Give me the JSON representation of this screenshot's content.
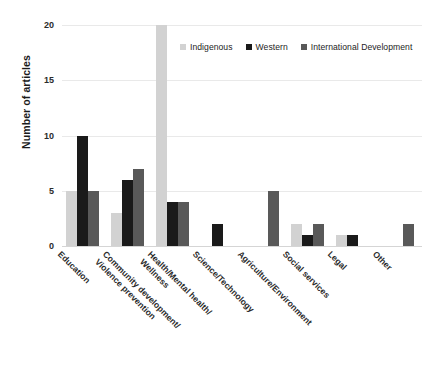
{
  "chart_data": {
    "type": "bar",
    "title": "",
    "subtitle": "",
    "xlabel": "",
    "ylabel": "Number of articles",
    "ylim": [
      0,
      20
    ],
    "yticks": [
      0,
      5,
      10,
      15,
      20
    ],
    "ytick_labels": [
      "0",
      "5",
      "10",
      "15",
      "20"
    ],
    "grid": true,
    "legend_position": "top-right",
    "categories": [
      "Education",
      "Community development/\nViolence prevention",
      "Health/Mental health/\nWellness",
      "Science/Technology",
      "Agriculture/Environment",
      "Social services",
      "Legal",
      "Other"
    ],
    "category_lines": [
      [
        "Education",
        ""
      ],
      [
        "Community development/",
        "Violence prevention"
      ],
      [
        "Health/Mental health/",
        "Wellness"
      ],
      [
        "Science/Technology",
        ""
      ],
      [
        "Agriculture/Environment",
        ""
      ],
      [
        "Social services",
        ""
      ],
      [
        "Legal",
        ""
      ],
      [
        "Other",
        ""
      ]
    ],
    "series": [
      {
        "name": "Indigenous",
        "color": "#d2d2d2",
        "values": [
          5,
          3,
          20,
          0,
          0,
          2,
          1,
          0
        ]
      },
      {
        "name": "Western",
        "color": "#1a1a1a",
        "values": [
          10,
          6,
          4,
          2,
          0,
          1,
          1,
          0
        ]
      },
      {
        "name": "International Development",
        "color": "#595959",
        "values": [
          5,
          7,
          4,
          0,
          5,
          2,
          0,
          2
        ]
      }
    ]
  },
  "legend": {
    "items": [
      {
        "label": "Indigenous",
        "color": "#d2d2d2"
      },
      {
        "label": "Western",
        "color": "#1a1a1a"
      },
      {
        "label": "International Development",
        "color": "#595959"
      }
    ]
  },
  "axis": {
    "y_title": "Number of articles"
  }
}
